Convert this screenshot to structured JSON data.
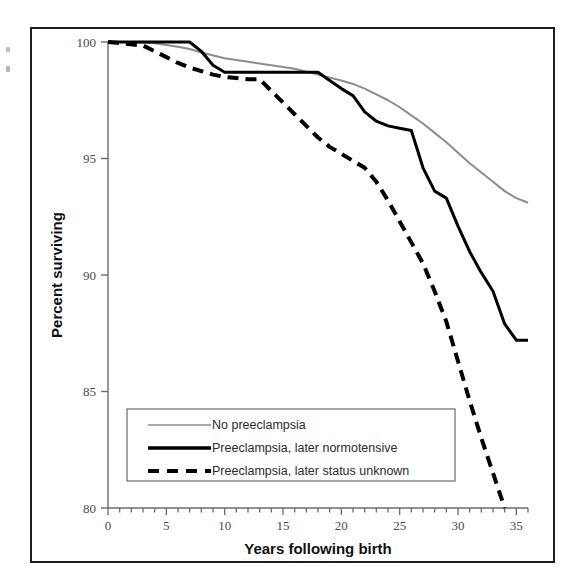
{
  "chart_data": {
    "type": "line",
    "title": "",
    "xlabel": "Years following birth",
    "ylabel": "Percent surviving",
    "xlim": [
      0,
      36
    ],
    "ylim": [
      80,
      100
    ],
    "xticks": [
      0,
      5,
      10,
      15,
      20,
      25,
      30,
      35
    ],
    "xtick_labels": [
      "0",
      "5",
      "10",
      "15",
      "20",
      "25",
      "30",
      "35"
    ],
    "yticks": [
      80,
      85,
      90,
      95,
      100
    ],
    "ytick_labels": [
      "80",
      "85",
      "90",
      "95",
      "100"
    ],
    "minor_xtick_interval": 1,
    "grid": false,
    "legend_position": "lower-left-inside",
    "series": [
      {
        "name": "No preeclampsia",
        "style": "solid",
        "color": "#8c8c8c",
        "width": 2,
        "x": [
          0,
          2,
          4,
          6,
          7,
          8,
          10,
          12,
          14,
          16,
          18,
          20,
          21,
          22,
          23,
          24,
          25,
          26,
          27,
          28,
          29,
          30,
          31,
          32,
          33,
          34,
          35,
          36
        ],
        "y": [
          100,
          100,
          99.95,
          99.8,
          99.7,
          99.55,
          99.3,
          99.15,
          99.0,
          98.85,
          98.6,
          98.35,
          98.2,
          98.0,
          97.75,
          97.5,
          97.2,
          96.85,
          96.5,
          96.1,
          95.7,
          95.25,
          94.8,
          94.4,
          94.0,
          93.6,
          93.3,
          93.1
        ]
      },
      {
        "name": "Preeclampsia, later normotensive",
        "style": "solid",
        "color": "#000000",
        "width": 3,
        "x": [
          0,
          7,
          8,
          9,
          10,
          11,
          14,
          16,
          18,
          19,
          20,
          21,
          22,
          23,
          24,
          25,
          26,
          27,
          28,
          29,
          30,
          31,
          32,
          33,
          34,
          35,
          36
        ],
        "y": [
          100,
          100,
          99.6,
          99.0,
          98.7,
          98.7,
          98.7,
          98.7,
          98.7,
          98.35,
          98.0,
          97.7,
          97.0,
          96.6,
          96.4,
          96.3,
          96.2,
          94.6,
          93.6,
          93.3,
          92.1,
          91.0,
          90.1,
          89.3,
          87.9,
          87.2,
          87.2
        ]
      },
      {
        "name": "Preeclampsia, later status unknown",
        "style": "dashed",
        "color": "#000000",
        "width": 4,
        "x": [
          0,
          3,
          4,
          5,
          6,
          7,
          8,
          9,
          10,
          11,
          12,
          13,
          14,
          15,
          16,
          17,
          18,
          19,
          20,
          21,
          22,
          23,
          24,
          25,
          26,
          27,
          28,
          29,
          30,
          31,
          32,
          33,
          34
        ],
        "y": [
          100,
          99.85,
          99.6,
          99.35,
          99.1,
          98.9,
          98.75,
          98.6,
          98.5,
          98.45,
          98.4,
          98.4,
          97.9,
          97.4,
          96.9,
          96.4,
          95.9,
          95.5,
          95.2,
          94.9,
          94.6,
          94.0,
          93.2,
          92.3,
          91.4,
          90.5,
          89.3,
          88.0,
          86.3,
          84.6,
          83.0,
          81.5,
          80.0
        ]
      }
    ],
    "legend_entries": [
      {
        "label": "No preeclampsia",
        "style": "solid",
        "color": "#8c8c8c"
      },
      {
        "label": "Preeclampsia, later normotensive",
        "style": "solid",
        "color": "#000000"
      },
      {
        "label": "Preeclampsia, later status unknown",
        "style": "dashed",
        "color": "#000000"
      }
    ]
  },
  "axes": {
    "x_title": "Years following birth",
    "y_title": "Percent surviving",
    "x_tick_labels": [
      "0",
      "5",
      "10",
      "15",
      "20",
      "25",
      "30",
      "35"
    ],
    "y_tick_labels": [
      "80",
      "85",
      "90",
      "95",
      "100"
    ]
  },
  "legend": {
    "item_0": "No preeclampsia",
    "item_1": "Preeclampsia, later normotensive",
    "item_2": "Preeclampsia, later status unknown"
  }
}
